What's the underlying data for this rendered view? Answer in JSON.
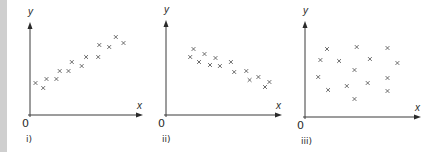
{
  "chart_data": [
    {
      "type": "scatter",
      "panel_label": "i)",
      "xlabel": "x",
      "ylabel": "y",
      "origin_label": "0",
      "xlim": [
        0,
        10
      ],
      "ylim": [
        0,
        10
      ],
      "grid": false,
      "marker": "x",
      "correlation": "positive",
      "points": [
        [
          0.5,
          3.2
        ],
        [
          1.2,
          2.7
        ],
        [
          1.5,
          3.6
        ],
        [
          2.4,
          3.6
        ],
        [
          2.7,
          4.4
        ],
        [
          3.5,
          4.4
        ],
        [
          3.8,
          5.3
        ],
        [
          4.7,
          4.9
        ],
        [
          5.1,
          5.8
        ],
        [
          6.2,
          5.8
        ],
        [
          6.3,
          7.0
        ],
        [
          7.2,
          6.8
        ],
        [
          7.8,
          7.8
        ],
        [
          8.5,
          7.2
        ]
      ]
    },
    {
      "type": "scatter",
      "panel_label": "ii)",
      "xlabel": "x",
      "ylabel": "y",
      "origin_label": "0",
      "xlim": [
        0,
        10
      ],
      "ylim": [
        0,
        10
      ],
      "grid": false,
      "marker": "x",
      "correlation": "negative",
      "points": [
        [
          2.2,
          5.8
        ],
        [
          2.5,
          6.6
        ],
        [
          3.0,
          5.3
        ],
        [
          3.5,
          6.1
        ],
        [
          4.0,
          5.0
        ],
        [
          4.5,
          5.7
        ],
        [
          4.9,
          4.9
        ],
        [
          5.9,
          5.3
        ],
        [
          6.2,
          4.3
        ],
        [
          7.3,
          4.4
        ],
        [
          7.6,
          3.5
        ],
        [
          8.4,
          3.8
        ],
        [
          9.0,
          2.8
        ],
        [
          9.4,
          3.3
        ]
      ]
    },
    {
      "type": "scatter",
      "panel_label": "iii)",
      "xlabel": "x",
      "ylabel": "y",
      "origin_label": "0",
      "xlim": [
        0,
        10
      ],
      "ylim": [
        0,
        10
      ],
      "grid": false,
      "marker": "x",
      "correlation": "none",
      "points": [
        [
          2.0,
          6.8
        ],
        [
          4.7,
          7.0
        ],
        [
          7.5,
          6.9
        ],
        [
          1.4,
          5.7
        ],
        [
          3.1,
          5.6
        ],
        [
          5.9,
          5.8
        ],
        [
          8.4,
          5.4
        ],
        [
          4.5,
          4.7
        ],
        [
          1.2,
          4.0
        ],
        [
          7.5,
          3.9
        ],
        [
          2.1,
          2.7
        ],
        [
          3.8,
          3.1
        ],
        [
          5.7,
          3.4
        ],
        [
          7.5,
          2.6
        ],
        [
          4.5,
          1.8
        ]
      ]
    }
  ],
  "colors": {
    "axis": "#3a3a3a",
    "marker": "#5a5a5a",
    "gutter": "#cfcfcf"
  }
}
